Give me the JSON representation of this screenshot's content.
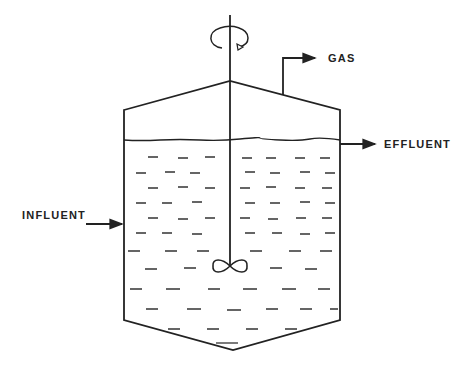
{
  "diagram": {
    "labels": {
      "gas": "GAS",
      "effluent": "EFFLUENT",
      "influent": "INFLUENT"
    },
    "components": [
      "vessel",
      "liquid-level",
      "stirrer-shaft",
      "impeller",
      "rotation-indicator",
      "gas-outlet",
      "effluent-outlet",
      "influent-inlet"
    ],
    "colors": {
      "line": "#222222",
      "background": "#ffffff"
    }
  }
}
